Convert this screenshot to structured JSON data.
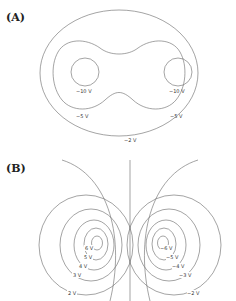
{
  "panels": [
    {
      "label": "(A)",
      "description": "Equipotential lines around two identical negative charges",
      "contours": [
        {
          "value": "−10 V",
          "shape": "circle-left"
        },
        {
          "value": "−10 V",
          "shape": "circle-right"
        },
        {
          "value": "−5 V",
          "shape": "peanut"
        },
        {
          "value": "−5 V",
          "shape": "peanut"
        },
        {
          "value": "−2 V",
          "shape": "outer-ellipse"
        }
      ]
    },
    {
      "label": "(B)",
      "description": "Equipotential lines around a dipole (positive left, negative right)",
      "left_contours": [
        "6 V",
        "5 V",
        "4 V",
        "3 V",
        "2 V"
      ],
      "right_contours": [
        "−6 V",
        "−5 V",
        "−4 V",
        "−3 V",
        "−2 V"
      ],
      "center_line": "0 V"
    }
  ]
}
